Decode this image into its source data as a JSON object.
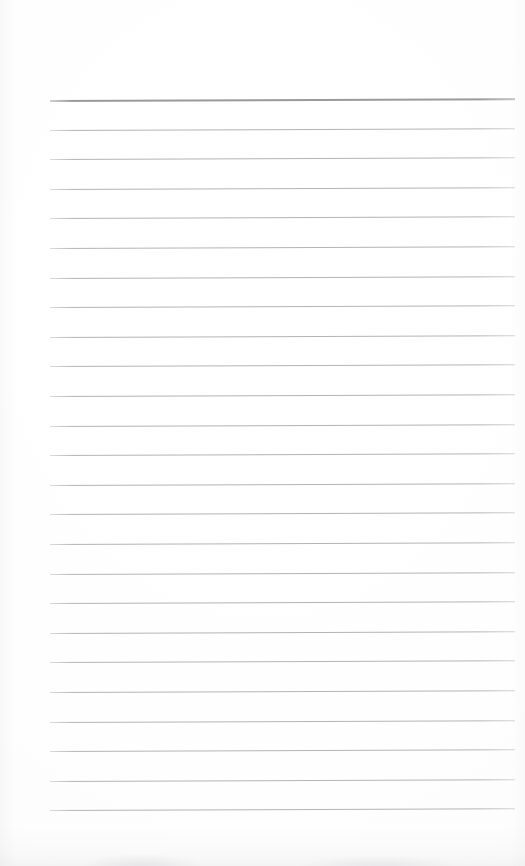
{
  "document": {
    "kind": "scanned-lined-paper",
    "title": "Lined Paper",
    "page_width": 525,
    "page_height": 866,
    "background_color": "#fefefe",
    "text_content": "",
    "is_blank": true
  },
  "ruling": {
    "line_count": 25,
    "first_line_y": 100,
    "line_spacing": 29.6,
    "left_x": 50,
    "right_x": 515,
    "skew_degrees": -0.22,
    "header_rule": {
      "index": 0,
      "color": "#9a9a9e",
      "thickness_px": 2,
      "description": "top header rule, darker and thicker than the body rules"
    },
    "body_rule": {
      "color": "#b3b4b8",
      "thickness_px": 1
    },
    "lines": [
      {
        "index": 0,
        "y": 100,
        "style": "header"
      },
      {
        "index": 1,
        "y": 130,
        "style": "normal"
      },
      {
        "index": 2,
        "y": 159,
        "style": "normal"
      },
      {
        "index": 3,
        "y": 189,
        "style": "normal"
      },
      {
        "index": 4,
        "y": 218,
        "style": "normal"
      },
      {
        "index": 5,
        "y": 248,
        "style": "normal"
      },
      {
        "index": 6,
        "y": 278,
        "style": "normal"
      },
      {
        "index": 7,
        "y": 307,
        "style": "normal"
      },
      {
        "index": 8,
        "y": 337,
        "style": "normal"
      },
      {
        "index": 9,
        "y": 366,
        "style": "normal"
      },
      {
        "index": 10,
        "y": 396,
        "style": "normal"
      },
      {
        "index": 11,
        "y": 426,
        "style": "normal"
      },
      {
        "index": 12,
        "y": 455,
        "style": "normal"
      },
      {
        "index": 13,
        "y": 485,
        "style": "normal"
      },
      {
        "index": 14,
        "y": 514,
        "style": "normal"
      },
      {
        "index": 15,
        "y": 544,
        "style": "normal"
      },
      {
        "index": 16,
        "y": 574,
        "style": "normal"
      },
      {
        "index": 17,
        "y": 603,
        "style": "normal"
      },
      {
        "index": 18,
        "y": 633,
        "style": "normal"
      },
      {
        "index": 19,
        "y": 662,
        "style": "normal"
      },
      {
        "index": 20,
        "y": 692,
        "style": "normal"
      },
      {
        "index": 21,
        "y": 722,
        "style": "normal"
      },
      {
        "index": 22,
        "y": 751,
        "style": "normal"
      },
      {
        "index": 23,
        "y": 781,
        "style": "normal"
      },
      {
        "index": 24,
        "y": 810,
        "style": "normal"
      }
    ]
  },
  "margins": {
    "top_blank_height": 100,
    "bottom_blank_height": 56,
    "left_blank_width": 50,
    "right_blank_width": 10
  },
  "artifacts": {
    "bottom_edge_smudge": true,
    "left_edge_shading": true,
    "right_edge_shading": true,
    "smudge_color": "#8c8c94"
  }
}
